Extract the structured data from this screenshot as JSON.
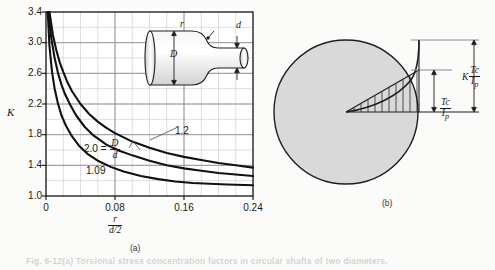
{
  "figure": {
    "caption": "Fig. 6-12(a)   Torsional stress concentration factors in circular shafts of two diameters.",
    "panel_a_tag": "(a)",
    "panel_b_tag": "(b)"
  },
  "chart_data": {
    "type": "line",
    "title": "",
    "xlabel_num": "r",
    "xlabel_den": "d/2",
    "ylabel": "K",
    "xlim": [
      0,
      0.24
    ],
    "ylim": [
      1.0,
      3.4
    ],
    "xticks": [
      0,
      0.08,
      0.16,
      0.24
    ],
    "xtick_labels": [
      "0",
      "0.08",
      "0.16",
      "0.24"
    ],
    "yticks": [
      1.0,
      1.4,
      1.8,
      2.2,
      2.6,
      3.0,
      3.4
    ],
    "ytick_labels": [
      "1.0",
      "1.4",
      "1.8",
      "2.2",
      "2.6",
      "3.0",
      "3.4"
    ],
    "grid": true,
    "grid_minor_x": 12,
    "grid_minor_y": 12,
    "legend_position": "inline-annotations",
    "series": [
      {
        "name": "2.0 = D/d",
        "label_main": "2.0 =",
        "label_num": "D",
        "label_den": "d",
        "x": [
          0.004,
          0.008,
          0.012,
          0.016,
          0.02,
          0.025,
          0.03,
          0.04,
          0.05,
          0.06,
          0.07,
          0.08,
          0.1,
          0.12,
          0.14,
          0.16,
          0.18,
          0.2,
          0.22,
          0.24
        ],
        "y": [
          3.4,
          3.1,
          2.9,
          2.74,
          2.62,
          2.48,
          2.37,
          2.2,
          2.07,
          1.97,
          1.89,
          1.82,
          1.71,
          1.63,
          1.56,
          1.51,
          1.47,
          1.43,
          1.4,
          1.37
        ]
      },
      {
        "name": "1.2",
        "label_main": "1.2",
        "x": [
          0.003,
          0.006,
          0.01,
          0.014,
          0.018,
          0.022,
          0.028,
          0.035,
          0.045,
          0.055,
          0.07,
          0.085,
          0.1,
          0.12,
          0.14,
          0.16,
          0.18,
          0.2,
          0.22,
          0.24
        ],
        "y": [
          3.4,
          3.07,
          2.8,
          2.6,
          2.45,
          2.33,
          2.19,
          2.05,
          1.9,
          1.79,
          1.67,
          1.59,
          1.53,
          1.46,
          1.4,
          1.36,
          1.33,
          1.3,
          1.28,
          1.26
        ]
      },
      {
        "name": "1.09",
        "label_main": "1.09",
        "x": [
          0.002,
          0.004,
          0.007,
          0.01,
          0.014,
          0.018,
          0.023,
          0.03,
          0.038,
          0.048,
          0.06,
          0.075,
          0.09,
          0.11,
          0.13,
          0.15,
          0.17,
          0.19,
          0.21,
          0.24
        ],
        "y": [
          3.4,
          2.96,
          2.62,
          2.4,
          2.2,
          2.05,
          1.92,
          1.78,
          1.66,
          1.55,
          1.46,
          1.38,
          1.32,
          1.26,
          1.22,
          1.19,
          1.17,
          1.16,
          1.15,
          1.14
        ]
      }
    ]
  },
  "inset_shaft": {
    "label_D": "D",
    "label_d": "d",
    "label_r": "r"
  },
  "panel_b": {
    "nominal_num": "Tc",
    "nominal_den": "I",
    "nominal_den_sub": "p",
    "peak_k": "K",
    "peak_num": "Tc",
    "peak_den": "I",
    "peak_den_sub": "p"
  },
  "colors": {
    "page_bg": "#fbfbfa",
    "curve": "#111111",
    "grid_minor": "#c9c9c9",
    "grid_major": "#8a8a8a",
    "axis": "#111111",
    "shape_fill": "#d9d9d9",
    "shaft_fill": "#e9e9e9",
    "text": "#1a1a1a"
  }
}
